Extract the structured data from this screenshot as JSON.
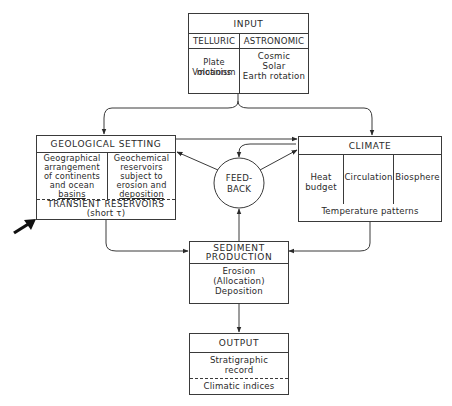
{
  "input": {
    "title": "INPUT",
    "telluric": {
      "header": "TELLURIC",
      "items": [
        "Plate motions",
        "Volcanism"
      ]
    },
    "astronomic": {
      "header": "ASTRONOMIC",
      "items": [
        "Cosmic",
        "Solar",
        "Earth rotation"
      ]
    }
  },
  "geological_setting": {
    "title": "GEOLOGICAL SETTING",
    "left": [
      "Geographical",
      "arrangement",
      "of continents",
      "and ocean",
      "basins"
    ],
    "right": [
      "Geochemical",
      "reservoirs",
      "subject to",
      "erosion and",
      "deposition"
    ],
    "transient": "TRANSIENT RESERVOIRS",
    "transient_sub": "(short τ)"
  },
  "feedback": {
    "lines": [
      "FEED-",
      "BACK"
    ]
  },
  "climate": {
    "title": "CLIMATE",
    "columns": [
      [
        "Heat",
        "budget"
      ],
      [
        "Circulation"
      ],
      [
        "Biosphere"
      ]
    ],
    "footer": "Temperature patterns"
  },
  "sediment_production": {
    "title": [
      "SEDIMENT",
      "PRODUCTION"
    ],
    "items": [
      "Erosion",
      "(Allocation)",
      "Deposition"
    ]
  },
  "output": {
    "title": "OUTPUT",
    "items": [
      "Stratigraphic",
      "record"
    ],
    "footer": "Climatic indices"
  },
  "pointer": {
    "icon": "pointer-arrow-icon",
    "target": "transient-reservoirs"
  }
}
